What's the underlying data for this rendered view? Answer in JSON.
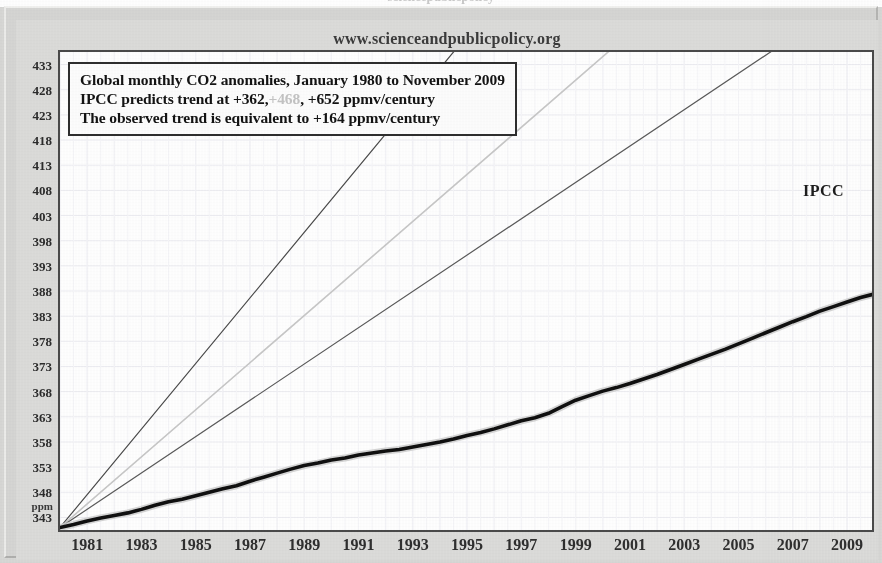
{
  "page": {
    "site_url": "www.scienceandpublicpolicy.org",
    "top_cropped_text": "sciencepublicpolicy"
  },
  "caption": {
    "line1": "Global monthly CO2 anomalies, January 1980 to November 2009",
    "line2_a": "IPCC predicts trend at +362,",
    "line2_faded": "+468",
    "line2_b": ", +652 ppmv/century",
    "line3": "The observed trend is equivalent to +164 ppmv/century"
  },
  "annotations": {
    "ipcc": "IPCC"
  },
  "colors": {
    "observed_line": "#101010",
    "ipcc_high": "#4a4a4a",
    "ipcc_mid": "#c8c8c8",
    "ipcc_low": "#5a5a5a",
    "observed_shadow": "#cfcfcf",
    "frame": "#4a4a4a",
    "panel_background": "#dcdcda",
    "plot_background": "#ffffff",
    "grid": "#ededf2"
  },
  "chart_data": {
    "type": "line",
    "title": "Global monthly CO2 anomalies, January 1980 to November 2009",
    "xlabel": "",
    "ylabel": "ppm",
    "xlim": [
      1980.0,
      2009.92
    ],
    "ylim": [
      340.5,
      435.5
    ],
    "grid": true,
    "legend_position": "none",
    "y_unit_label": "ppm",
    "yticks": [
      433,
      428,
      423,
      418,
      413,
      408,
      403,
      398,
      393,
      388,
      383,
      378,
      373,
      368,
      363,
      358,
      353,
      348,
      343
    ],
    "xticks": [
      1981,
      1983,
      1985,
      1987,
      1989,
      1991,
      1993,
      1995,
      1997,
      1999,
      2001,
      2003,
      2005,
      2007,
      2009
    ],
    "series": [
      {
        "name": "IPCC high projection (+652 ppmv/century)",
        "style": "thin-solid",
        "color": "#4a4a4a",
        "trend_ppmv_per_century": 652,
        "x": [
          1980.0,
          2009.92
        ],
        "values": [
          341.0,
          536.0
        ]
      },
      {
        "name": "IPCC mid projection (+468 ppmv/century)",
        "style": "thin-solid-faded",
        "color": "#c8c8c8",
        "trend_ppmv_per_century": 468,
        "x": [
          1980.0,
          2009.92
        ],
        "values": [
          341.0,
          481.0
        ]
      },
      {
        "name": "IPCC low projection (+362 ppmv/century)",
        "style": "thin-solid",
        "color": "#5a5a5a",
        "trend_ppmv_per_century": 362,
        "x": [
          1980.0,
          2009.92
        ],
        "values": [
          341.0,
          449.0
        ]
      },
      {
        "name": "Observed global monthly CO2",
        "style": "thick-solid",
        "color": "#101010",
        "trend_ppmv_per_century": 164,
        "x": [
          1980.0,
          1980.5,
          1981.0,
          1981.5,
          1982.0,
          1982.5,
          1983.0,
          1983.5,
          1984.0,
          1984.5,
          1985.0,
          1985.5,
          1986.0,
          1986.5,
          1987.0,
          1987.5,
          1988.0,
          1988.5,
          1989.0,
          1989.5,
          1990.0,
          1990.5,
          1991.0,
          1991.5,
          1992.0,
          1992.5,
          1993.0,
          1993.5,
          1994.0,
          1994.5,
          1995.0,
          1995.5,
          1996.0,
          1996.5,
          1997.0,
          1997.5,
          1998.0,
          1998.5,
          1999.0,
          1999.5,
          2000.0,
          2000.5,
          2001.0,
          2001.5,
          2002.0,
          2002.5,
          2003.0,
          2003.5,
          2004.0,
          2004.5,
          2005.0,
          2005.5,
          2006.0,
          2006.5,
          2007.0,
          2007.5,
          2008.0,
          2008.5,
          2009.0,
          2009.5,
          2009.92
        ],
        "values": [
          341.0,
          341.6,
          342.3,
          342.9,
          343.4,
          343.9,
          344.6,
          345.4,
          346.1,
          346.6,
          347.3,
          348.0,
          348.7,
          349.3,
          350.2,
          351.0,
          351.8,
          352.6,
          353.3,
          353.8,
          354.4,
          354.8,
          355.4,
          355.8,
          356.2,
          356.5,
          357.0,
          357.5,
          358.0,
          358.6,
          359.3,
          359.9,
          360.6,
          361.4,
          362.2,
          362.8,
          363.7,
          365.0,
          366.3,
          367.2,
          368.1,
          368.8,
          369.6,
          370.5,
          371.4,
          372.4,
          373.4,
          374.4,
          375.4,
          376.4,
          377.5,
          378.6,
          379.7,
          380.8,
          381.9,
          382.9,
          384.0,
          384.9,
          385.8,
          386.7,
          387.3
        ]
      }
    ]
  }
}
